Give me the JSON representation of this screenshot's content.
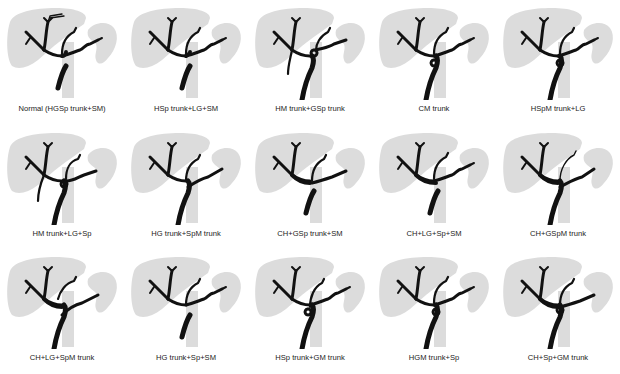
{
  "figure": {
    "colors": {
      "organ": "#dcdcdc",
      "vessel": "#111111",
      "label": "#222222"
    },
    "layout": {
      "rows": 3,
      "columns": 5
    },
    "panels": [
      {
        "label": "Normal (HGSp trunk+SM)",
        "variant": "normal"
      },
      {
        "label": "HSp trunk+LG+SM",
        "variant": "hsp"
      },
      {
        "label": "HM trunk+GSp trunk",
        "variant": "hm_gsp"
      },
      {
        "label": "CM trunk",
        "variant": "cm"
      },
      {
        "label": "HSpM trunk+LG",
        "variant": "hspm"
      },
      {
        "label": "HM trunk+LG+Sp",
        "variant": "hm_lg"
      },
      {
        "label": "HG trunk+SpM trunk",
        "variant": "hg_spm"
      },
      {
        "label": "CH+GSp trunk+SM",
        "variant": "ch_gsp"
      },
      {
        "label": "CH+LG+Sp+SM",
        "variant": "ch_lg"
      },
      {
        "label": "CH+GSpM trunk",
        "variant": "ch_gspm"
      },
      {
        "label": "CH+LG+SpM trunk",
        "variant": "ch_lg_spm"
      },
      {
        "label": "HG trunk+Sp+SM",
        "variant": "hg_sp"
      },
      {
        "label": "HSp trunk+GM trunk",
        "variant": "hsp_gm"
      },
      {
        "label": "HGM trunk+Sp",
        "variant": "hgm"
      },
      {
        "label": "CH+Sp+GM trunk",
        "variant": "ch_sp_gm"
      }
    ]
  }
}
